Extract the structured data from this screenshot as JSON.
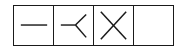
{
  "diagram": {
    "type": "symbol-grid",
    "stroke_color": "#1a1a1a",
    "background_color": "#ffffff",
    "cells": [
      {
        "index": 0,
        "symbol": "horizontal-line",
        "label": "one"
      },
      {
        "index": 1,
        "symbol": "crow-foot",
        "label": "many"
      },
      {
        "index": 2,
        "symbol": "cross",
        "label": "x"
      },
      {
        "index": 3,
        "symbol": "empty",
        "label": ""
      }
    ]
  }
}
